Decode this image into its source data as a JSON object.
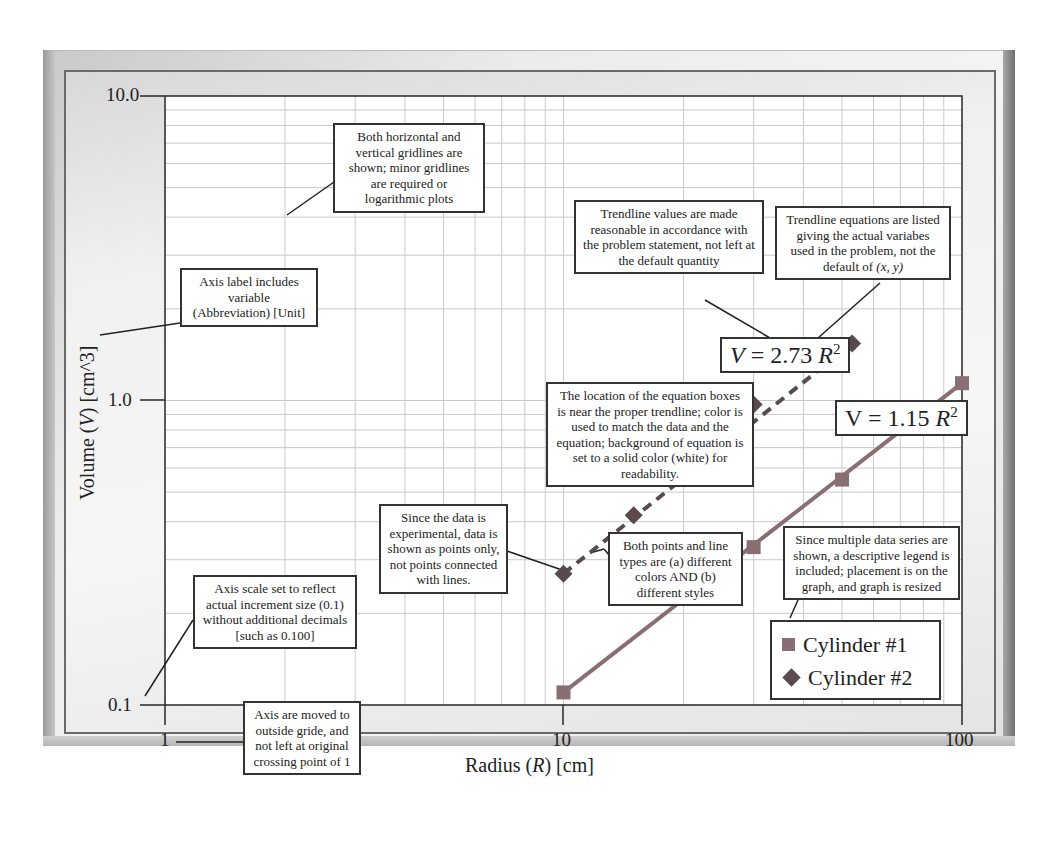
{
  "chart_data": {
    "type": "scatter",
    "title": "",
    "xlabel": "Radius (R) [cm]",
    "ylabel": "Volume (V) [cm^3]",
    "xscale": "log",
    "yscale": "log",
    "xlim": [
      1,
      100
    ],
    "ylim": [
      0.1,
      10.0
    ],
    "x_ticks": [
      "1",
      "10",
      "100"
    ],
    "y_ticks": [
      "0.1",
      "1.0",
      "10.0"
    ],
    "grid": {
      "major": true,
      "minor": true
    },
    "legend": {
      "position": "lower right, inside plot",
      "entries": [
        "Cylinder #1",
        "Cylinder #2"
      ]
    },
    "series": [
      {
        "name": "Cylinder #1",
        "marker": "square",
        "color": "#8a6f72",
        "trendline": "solid",
        "x": [
          10,
          30,
          50,
          100
        ],
        "y": [
          0.11,
          0.33,
          0.55,
          1.14
        ],
        "equation": "V = 1.15 R^2"
      },
      {
        "name": "Cylinder #2",
        "marker": "diamond",
        "color": "#5a4a4e",
        "trendline": "dashed",
        "x": [
          10,
          15,
          30,
          53
        ],
        "y": [
          0.27,
          0.42,
          0.97,
          1.54
        ],
        "equation": "V = 2.73 R^2"
      }
    ],
    "annotations": [
      "Both horizontal and vertical gridlines are shown; minor gridlines are required or logarithmic plots",
      "Trendline values are made reasonable in accordance with the problem statement, not left at the default quantity",
      "Trendline equations are listed giving the actual variabes used in the problem, not the default of (x, y)",
      "Axis label includes variable (Abbreviation) [Unit]",
      "The location of the equation boxes is near the proper trendline; color is used to match the data and the equation; background of equation is set to a solid color (white) for readability.",
      "Since the data is experimental, data is shown as points only, not points connected with lines.",
      "Both points and line types are (a) different colors AND (b) different styles",
      "Since multiple data series are shown, a descriptive legend is included; placement is on the graph, and graph is resized",
      "Axis scale set to reflect actual increment size (0.1) without additional decimals [such as 0.100]",
      "Axis are moved to outside gride, and not left at original crossing point of 1"
    ]
  },
  "axes": {
    "x": {
      "title_pre": "Radius (",
      "title_var": "R",
      "title_post": ") [cm]",
      "ticks": [
        "1",
        "10",
        "100"
      ]
    },
    "y": {
      "title_pre": "Volume (",
      "title_var": "V",
      "title_post": ") [cm^3]",
      "ticks": [
        "0.1",
        "1.0",
        "10.0"
      ]
    }
  },
  "equations": {
    "eq2": {
      "lhs": "V",
      "mid": " = 2.73 ",
      "var": "R",
      "exp": "2"
    },
    "eq1": {
      "lhs": "V",
      "mid": " = 1.15 ",
      "var": "R",
      "exp": "2"
    }
  },
  "legend": {
    "items": [
      {
        "label": "Cylinder #1"
      },
      {
        "label": "Cylinder #2"
      }
    ]
  },
  "notes": {
    "gridlines": "Both horizontal and vertical gridlines are shown; minor gridlines are required or logarithmic plots",
    "trend_values": "Trendline values are made reasonable in accordance with the problem statement, not left at the default quantity",
    "trend_eq_pre": "Trendline equations are listed giving the actual variabes used in the problem, not the default of ",
    "trend_eq_vars": "(x, y)",
    "axis_label": "Axis label includes variable (Abbreviation) [Unit]",
    "eq_location": "The location of the equation boxes is near the proper trendline; color is used to match the data and the equation; background of equation is set to a solid color (white) for readability.",
    "experimental": "Since the data is experimental, data is shown as points only, not points connected with lines.",
    "styles": "Both points and line types are (a) different colors AND (b) different styles",
    "legend_note": "Since multiple data series are shown, a descriptive legend is included; placement is on the graph, and graph is resized",
    "axis_scale": "Axis scale set to reflect actual increment size (0.1) without additional decimals [such as 0.100]",
    "axis_moved": "Axis are moved to outside gride, and not left at original crossing point of 1"
  }
}
